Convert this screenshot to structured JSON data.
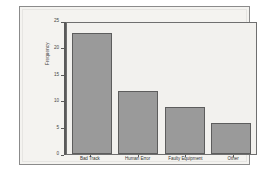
{
  "chart_data": {
    "type": "bar",
    "title": "",
    "xlabel": "",
    "ylabel": "Frequency",
    "categories": [
      "Bad Track",
      "Human Error",
      "Faulty Equipment",
      "Other"
    ],
    "values": [
      23,
      12,
      9,
      6
    ],
    "ylim": [
      0,
      25
    ],
    "yticks": [
      0,
      5,
      10,
      15,
      20,
      25
    ],
    "ytick_labels": [
      "0",
      "5",
      "10",
      "15",
      "20",
      "25"
    ],
    "grid": false,
    "legend": null,
    "bar_color": "#9a9a9a",
    "bar_edge_color": "#5d5d5d",
    "plot_background": "#f2f1ee",
    "panel_background": "#f4f3f0",
    "axis_color": "#5a5a5a"
  }
}
